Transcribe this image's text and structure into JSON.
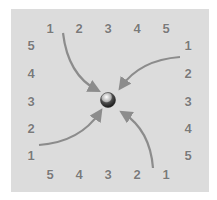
{
  "diagram": {
    "top_labels": [
      "1",
      "2",
      "3",
      "4",
      "5"
    ],
    "right_labels": [
      "1",
      "2",
      "3",
      "4",
      "5"
    ],
    "bottom_labels": [
      "5",
      "4",
      "3",
      "2",
      "1"
    ],
    "left_labels": [
      "5",
      "4",
      "3",
      "2",
      "1"
    ],
    "center": "sphere",
    "arrow_color": "#8c8c8c",
    "background_color": "#dcdcdc"
  }
}
